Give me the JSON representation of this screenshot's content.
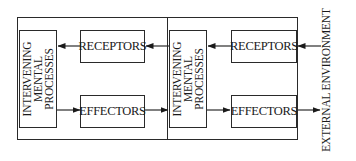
{
  "diagram": {
    "panels": [
      {
        "id": "inner",
        "mental": {
          "lines": [
            "INTERVENING",
            "MENTAL",
            "PROCESSES"
          ]
        },
        "receptors": {
          "label": "RECEPTORS"
        },
        "effectors": {
          "label": "EFFECTORS"
        }
      },
      {
        "id": "outer",
        "mental": {
          "lines": [
            "INTERVENING",
            "MENTAL",
            "PROCESSES"
          ]
        },
        "receptors": {
          "label": "RECEPTORS"
        },
        "effectors": {
          "label": "EFFECTORS"
        }
      }
    ],
    "external": {
      "label": "EXTERNAL ENVIRONMENT"
    },
    "flows": [
      {
        "from": "external-environment",
        "to": "receptors-2"
      },
      {
        "from": "receptors-2",
        "to": "mental-processes-2"
      },
      {
        "from": "mental-processes-2",
        "to": "receptors-1"
      },
      {
        "from": "receptors-1",
        "to": "mental-processes-1"
      },
      {
        "from": "mental-processes-1",
        "to": "effectors-1"
      },
      {
        "from": "effectors-1",
        "to": "mental-processes-2"
      },
      {
        "from": "mental-processes-2",
        "to": "effectors-2"
      },
      {
        "from": "effectors-2",
        "to": "external-environment"
      }
    ],
    "line_color": "#2a2a2a"
  }
}
